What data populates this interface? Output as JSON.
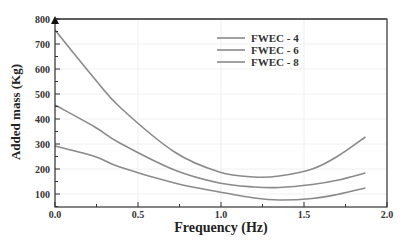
{
  "chart_data": {
    "type": "line",
    "title": "",
    "xlabel": "Frequency (Hz)",
    "ylabel": "Added mass (Kg)",
    "xlim": [
      0.0,
      2.0
    ],
    "ylim": [
      48,
      800
    ],
    "xticks": [
      "0.0",
      "0.5",
      "1.0",
      "1.5",
      "2.0"
    ],
    "yticks": [
      "100",
      "200",
      "300",
      "400",
      "500",
      "600",
      "700",
      "800"
    ],
    "grid": true,
    "legend_position": "upper right",
    "line_color": "#8a8a8a",
    "x": [
      0.0,
      0.24,
      0.39,
      0.72,
      0.99,
      1.2,
      1.35,
      1.55,
      1.7,
      1.87
    ],
    "series": [
      {
        "name": "FWEC - 4",
        "values": [
          756,
          560,
          448,
          268,
          188,
          168,
          172,
          200,
          250,
          328
        ]
      },
      {
        "name": "FWEC - 6",
        "values": [
          456,
          368,
          304,
          196,
          144,
          128,
          126,
          138,
          155,
          184
        ]
      },
      {
        "name": "FWEC - 8",
        "values": [
          292,
          250,
          208,
          144,
          108,
          84,
          76,
          82,
          98,
          124
        ]
      }
    ]
  }
}
